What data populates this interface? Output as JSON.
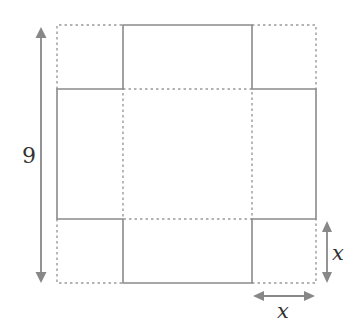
{
  "diagram": {
    "outer_square_side_label": "9",
    "corner_cut_labels": {
      "vertical": "x",
      "horizontal": "x"
    },
    "colors": {
      "lines": "#8a8a8a",
      "arrows": "#888888",
      "text": "#333333"
    }
  }
}
